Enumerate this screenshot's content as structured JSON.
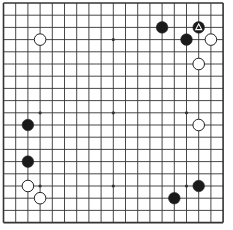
{
  "board": {
    "size": 19,
    "background": "#ffffff",
    "line_color": "#333333",
    "black_color": "#1a1a1a",
    "white_color": "#ffffff",
    "star_points": [
      [
        3,
        3
      ],
      [
        9,
        3
      ],
      [
        15,
        3
      ],
      [
        3,
        9
      ],
      [
        9,
        9
      ],
      [
        15,
        9
      ],
      [
        3,
        15
      ],
      [
        9,
        15
      ],
      [
        15,
        15
      ]
    ],
    "stones": [
      {
        "color": "white",
        "col": 3,
        "row": 3
      },
      {
        "color": "black",
        "col": 13,
        "row": 2
      },
      {
        "color": "black",
        "col": 16,
        "row": 2,
        "marker": "triangle"
      },
      {
        "color": "black",
        "col": 15,
        "row": 3
      },
      {
        "color": "white",
        "col": 17,
        "row": 3
      },
      {
        "color": "white",
        "col": 16,
        "row": 5
      },
      {
        "color": "white",
        "col": 16,
        "row": 10
      },
      {
        "color": "black",
        "col": 16,
        "row": 15
      },
      {
        "color": "black",
        "col": 14,
        "row": 16
      },
      {
        "color": "black",
        "col": 2,
        "row": 10
      },
      {
        "color": "black",
        "col": 2,
        "row": 13
      },
      {
        "color": "white",
        "col": 2,
        "row": 15
      },
      {
        "color": "white",
        "col": 3,
        "row": 16
      }
    ]
  }
}
